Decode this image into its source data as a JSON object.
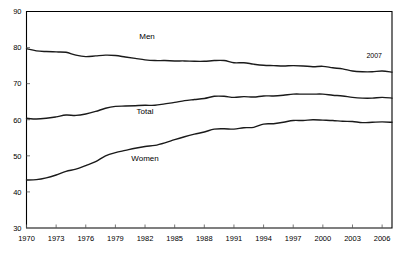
{
  "chart_data": {
    "type": "line",
    "title": "",
    "subtitle": "",
    "xlabel": "",
    "ylabel": "",
    "xlim": [
      1970,
      2007
    ],
    "ylim": [
      30,
      90
    ],
    "grid": false,
    "legend_position": "inline-labels",
    "y_ticks": [
      30,
      40,
      50,
      60,
      70,
      80,
      90
    ],
    "x_ticks": [
      1970,
      1973,
      1976,
      1979,
      1982,
      1985,
      1988,
      1991,
      1994,
      1997,
      2000,
      2003,
      2006
    ],
    "x": [
      1970,
      1971,
      1972,
      1973,
      1974,
      1975,
      1976,
      1977,
      1978,
      1979,
      1980,
      1981,
      1982,
      1983,
      1984,
      1985,
      1986,
      1987,
      1988,
      1989,
      1990,
      1991,
      1992,
      1993,
      1994,
      1995,
      1996,
      1997,
      1998,
      1999,
      2000,
      2001,
      2002,
      2003,
      2004,
      2005,
      2006,
      2007
    ],
    "series": [
      {
        "name": "Men",
        "label": "Men",
        "color": "#1a1a1a",
        "values": [
          79.7,
          79.1,
          78.9,
          78.8,
          78.7,
          77.9,
          77.5,
          77.7,
          77.9,
          77.8,
          77.4,
          77.0,
          76.6,
          76.4,
          76.4,
          76.3,
          76.3,
          76.2,
          76.2,
          76.4,
          76.4,
          75.8,
          75.8,
          75.4,
          75.1,
          75.0,
          74.9,
          75.0,
          74.9,
          74.7,
          74.8,
          74.4,
          74.1,
          73.5,
          73.3,
          73.3,
          73.5,
          73.2
        ]
      },
      {
        "name": "Total",
        "label": "Total",
        "color": "#1a1a1a",
        "values": [
          60.4,
          60.2,
          60.4,
          60.8,
          61.3,
          61.2,
          61.6,
          62.3,
          63.2,
          63.7,
          63.8,
          63.9,
          64.0,
          64.0,
          64.4,
          64.8,
          65.3,
          65.6,
          65.9,
          66.5,
          66.5,
          66.2,
          66.4,
          66.3,
          66.6,
          66.6,
          66.8,
          67.1,
          67.1,
          67.1,
          67.1,
          66.8,
          66.6,
          66.2,
          66.0,
          66.0,
          66.2,
          66.0
        ]
      },
      {
        "name": "Women",
        "label": "Women",
        "color": "#1a1a1a",
        "values": [
          43.3,
          43.4,
          43.9,
          44.7,
          45.7,
          46.3,
          47.3,
          48.4,
          50.0,
          50.9,
          51.5,
          52.1,
          52.6,
          52.9,
          53.6,
          54.5,
          55.3,
          56.0,
          56.6,
          57.4,
          57.5,
          57.4,
          57.8,
          57.9,
          58.8,
          58.9,
          59.3,
          59.8,
          59.8,
          60.0,
          59.9,
          59.8,
          59.6,
          59.5,
          59.2,
          59.3,
          59.4,
          59.3
        ]
      }
    ],
    "annotations": [
      {
        "text": "2007",
        "x": 2005.2,
        "y": 77.0,
        "name": "year-annotation-2007"
      }
    ],
    "series_label_positions": [
      {
        "text": "Men",
        "x": 1982.2,
        "y": 82.5
      },
      {
        "text": "Total",
        "x": 1982.0,
        "y": 61.7
      },
      {
        "text": "Women",
        "x": 1982.0,
        "y": 48.5
      }
    ]
  }
}
